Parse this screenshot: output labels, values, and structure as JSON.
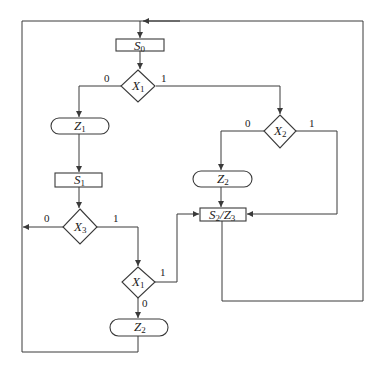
{
  "diagram": {
    "type": "ASM flowchart",
    "nodes": {
      "s0": {
        "kind": "state",
        "label": "S",
        "sub": "0"
      },
      "x1_top": {
        "kind": "decision",
        "label": "X",
        "sub": "1"
      },
      "z1": {
        "kind": "conditional-output",
        "label": "Z",
        "sub": "1"
      },
      "s1": {
        "kind": "state",
        "label": "S",
        "sub": "1"
      },
      "x3": {
        "kind": "decision",
        "label": "X",
        "sub": "3"
      },
      "x1_bottom": {
        "kind": "decision",
        "label": "X",
        "sub": "1"
      },
      "z2_bottom": {
        "kind": "conditional-output",
        "label": "Z",
        "sub": "2"
      },
      "x2": {
        "kind": "decision",
        "label": "X",
        "sub": "2"
      },
      "z2_right": {
        "kind": "conditional-output",
        "label": "Z",
        "sub": "2"
      },
      "s2z3": {
        "kind": "state",
        "label_a": "S",
        "sub_a": "2",
        "sep": "/",
        "label_b": "Z",
        "sub_b": "3"
      }
    },
    "edge_labels": {
      "x1_top_0": "0",
      "x1_top_1": "1",
      "x2_0": "0",
      "x2_1": "1",
      "x3_0": "0",
      "x3_1": "1",
      "x1_bottom_1": "1",
      "x1_bottom_0": "0"
    },
    "colors": {
      "line": "#3a3a3a",
      "background": "#ffffff"
    }
  }
}
